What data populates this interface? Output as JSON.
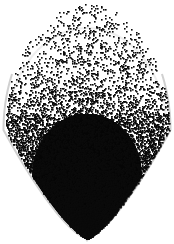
{
  "figure": {
    "title": "Point Cloud Density Scatter",
    "width": 174,
    "height": 244,
    "background_color": "#ffffff",
    "point_color": "#0a0a0a",
    "halo_color": "#c8c8c8",
    "tip_marker_color": "#d0d0d0",
    "has_axes": false,
    "has_frame": false,
    "has_gridlines": false,
    "has_legend": false,
    "has_tick_labels": false
  },
  "chart_data": {
    "type": "scatter",
    "title": "",
    "subtitle": "",
    "xlabel": "",
    "ylabel": "",
    "xlim": [
      0,
      174
    ],
    "ylim": [
      0,
      244
    ],
    "grid": false,
    "legend": null,
    "tick_labels": {
      "x": [],
      "y": []
    },
    "annotations": [],
    "marker": {
      "shape": "square",
      "size_px": 1.6,
      "color": "#0a0a0a",
      "opacity": 1
    },
    "total_points": 9000,
    "silhouette": {
      "shape": "teardrop",
      "apex": [
        87,
        4
      ],
      "bottom_tip": [
        87,
        238
      ],
      "widest_y": 130,
      "half_width_at_widest": 82
    },
    "density_profile": {
      "note": "Relative point density sampled top to bottom along the vertical axis.",
      "y": [
        5,
        25,
        50,
        75,
        100,
        120,
        140,
        160,
        180,
        200,
        220,
        238
      ],
      "density": [
        0.05,
        0.12,
        0.22,
        0.34,
        0.55,
        0.78,
        0.9,
        0.97,
        1.0,
        1.0,
        0.98,
        0.6
      ]
    },
    "core": {
      "center": [
        87,
        175
      ],
      "rx": 55,
      "ry": 62,
      "fill": "#050505",
      "note": "Saturated black dense core region"
    },
    "halo": {
      "center": [
        87,
        132
      ],
      "rx": 80,
      "ry": 104,
      "stroke": "#c8c8c8",
      "stroke_width": 2,
      "note": "Faint gray outer boundary arc, strongest on the lower left and lower right flanks"
    }
  }
}
